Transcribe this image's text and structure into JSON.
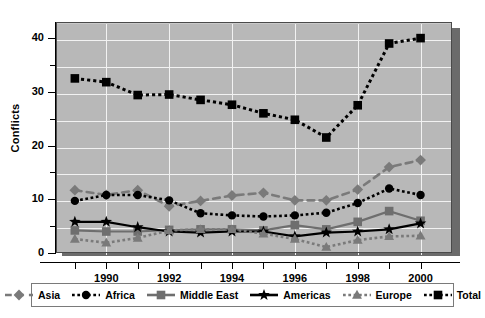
{
  "chart_data": {
    "type": "line",
    "title": "",
    "xlabel": "",
    "ylabel": "Conflicts",
    "xlim": [
      1988.4,
      2001.0
    ],
    "ylim": [
      0,
      43
    ],
    "ytick_values": [
      0,
      10,
      20,
      30,
      40
    ],
    "ytick_labels": [
      "0",
      "10",
      "20",
      "30",
      "40"
    ],
    "ytick_minor": [
      5,
      15,
      25,
      35
    ],
    "xtick_labels": [
      "1990",
      "1992",
      "1994",
      "1996",
      "1998",
      "2000"
    ],
    "xtick_label_values": [
      1990,
      1992,
      1994,
      1996,
      1998,
      2000
    ],
    "xtick_minor": [
      1989,
      1991,
      1993,
      1995,
      1997,
      1999
    ],
    "grid": "both",
    "legend_position": "bottom",
    "x": [
      1989,
      1990,
      1991,
      1992,
      1993,
      1994,
      1995,
      1996,
      1997,
      1998,
      1999,
      2000
    ],
    "series": [
      {
        "name": "Asia",
        "marker": "diamond",
        "line_style": "dashed",
        "color": "#7a7a7a",
        "values": [
          11.7,
          10.8,
          11.7,
          8.7,
          9.7,
          10.7,
          11.2,
          9.8,
          9.8,
          11.8,
          16.0,
          17.3
        ]
      },
      {
        "name": "Africa",
        "marker": "circle",
        "line_style": "dotted",
        "color": "#000000",
        "values": [
          9.7,
          10.8,
          10.8,
          9.8,
          7.4,
          7.0,
          6.8,
          7.0,
          7.5,
          9.3,
          12.0,
          10.8
        ]
      },
      {
        "name": "Middle East",
        "marker": "square",
        "line_style": "solid",
        "color": "#6e6e6e",
        "values": [
          4.2,
          4.0,
          4.0,
          4.3,
          4.4,
          4.4,
          4.2,
          5.2,
          4.4,
          5.8,
          7.8,
          6.0
        ]
      },
      {
        "name": "Americas",
        "marker": "star",
        "line_style": "solid",
        "color": "#000000",
        "values": [
          5.8,
          5.8,
          4.8,
          4.0,
          3.8,
          4.0,
          4.0,
          3.1,
          3.8,
          4.0,
          4.4,
          5.5
        ]
      },
      {
        "name": "Europe",
        "marker": "triangle",
        "line_style": "dotted",
        "color": "#7a7a7a",
        "values": [
          2.6,
          1.9,
          2.8,
          4.2,
          4.4,
          4.4,
          3.6,
          2.6,
          1.1,
          2.4,
          3.1,
          3.2
        ]
      },
      {
        "name": "Total",
        "marker": "filled-square",
        "line_style": "dotted",
        "color": "#000000",
        "values": [
          32.5,
          31.8,
          29.4,
          29.5,
          28.5,
          27.6,
          26.0,
          24.8,
          21.5,
          27.5,
          39.0,
          40.0
        ]
      }
    ]
  },
  "legend": {
    "items": [
      {
        "label": "Asia"
      },
      {
        "label": "Africa"
      },
      {
        "label": "Middle East"
      },
      {
        "label": "Americas"
      },
      {
        "label": "Europe"
      },
      {
        "label": "Total"
      }
    ]
  }
}
